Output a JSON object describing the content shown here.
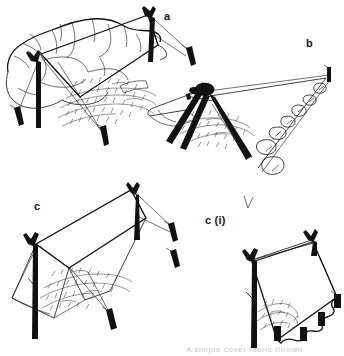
{
  "figure": {
    "medium": "black-and-white pen-and-ink line drawing (scanned)",
    "background_color": "#ffffff",
    "ink_color": "#111111",
    "caption": "A simple cover fabric thrown",
    "caption_note": "clipped at bottom edge of image"
  },
  "panels": [
    {
      "id": "a",
      "label": "a",
      "label_x": 168,
      "label_y": 17,
      "description": "Lean-to sheet pitched from a rock outcrop, supported on a forked stick and guyed to angled pegs"
    },
    {
      "id": "b",
      "label": "b",
      "label_x": 310,
      "label_y": 44,
      "description": "Sheet over a lashed tripod of poles with the lower edge weighted down by a line of stones"
    },
    {
      "id": "c",
      "label": "c",
      "label_x": 38,
      "label_y": 207,
      "description": "Sheet ridged between a forked upright pole and a pegged pole, guyed out at both ends"
    },
    {
      "id": "c_i",
      "label": "c (i)",
      "label_x": 218,
      "label_y": 222,
      "description": "Plan-style view of the same pitch showing the pegged-out perimeter of the sheet"
    }
  ],
  "elements": {
    "rock_outcrop": "boulder / rock overhang",
    "forked_pole": "forked upright support stick",
    "tripod": "lashed pole tripod",
    "stones": "row of weighting stones",
    "pegs": "guy-line pegs driven into the ground",
    "guy_lines": "cord guy lines",
    "ground_hatching": "stippled ground / grass texture",
    "sheet": "tarpaulin / cover sheet"
  }
}
